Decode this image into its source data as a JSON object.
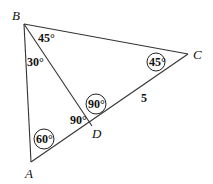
{
  "figure": {
    "vertices": {
      "A": {
        "label": "A",
        "x": 31,
        "y": 162
      },
      "B": {
        "label": "B",
        "x": 24,
        "y": 24
      },
      "C": {
        "label": "C",
        "x": 188,
        "y": 54
      },
      "D": {
        "label": "D",
        "x": 92,
        "y": 126
      }
    },
    "segments": [
      "AB",
      "BC",
      "CA",
      "BD"
    ],
    "angles": {
      "angle_CBD": {
        "text": "45°",
        "circled": false
      },
      "angle_ABD": {
        "text": "30°",
        "circled": false
      },
      "angle_BCA": {
        "text": "45°",
        "circled": true
      },
      "angle_BDC": {
        "text": "90°",
        "circled": true
      },
      "angle_BDA": {
        "text": "90°",
        "circled": false
      },
      "angle_BAC": {
        "text": "60°",
        "circled": true
      }
    },
    "side_labels": {
      "DC": {
        "text": "5"
      }
    },
    "colors": {
      "line": "#333333",
      "text": "#111111",
      "background": "#ffffff"
    }
  }
}
